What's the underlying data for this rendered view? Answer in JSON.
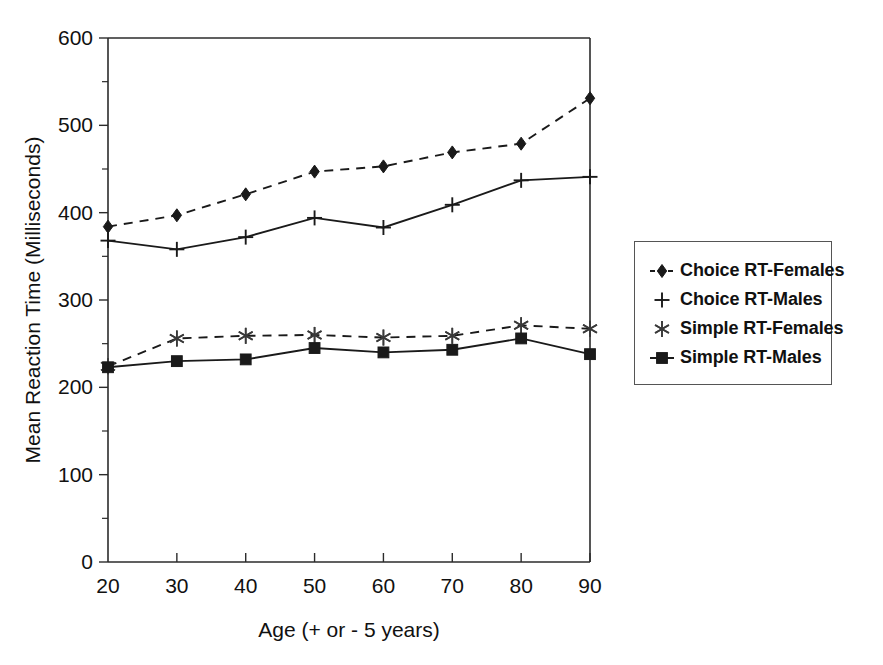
{
  "chart_data": {
    "type": "line",
    "title": "",
    "xlabel": "Age (+ or - 5 years)",
    "ylabel": "Mean Reaction Time (Milliseconds)",
    "x": [
      20,
      30,
      40,
      50,
      60,
      70,
      80,
      90
    ],
    "xtick_labels": [
      "20",
      "30",
      "40",
      "50",
      "60",
      "70",
      "80",
      "90"
    ],
    "ytick_labels": [
      "0",
      "100",
      "200",
      "300",
      "400",
      "500",
      "600"
    ],
    "yticks": [
      0,
      100,
      200,
      300,
      400,
      500,
      600
    ],
    "xlim": [
      20,
      90
    ],
    "ylim": [
      0,
      600
    ],
    "minor_ticks": true,
    "grid": false,
    "legend_position": "right",
    "series": [
      {
        "name": "Choice RT-Females",
        "marker": "diamond",
        "linestyle": "dashed",
        "values": [
          384,
          397,
          421,
          447,
          453,
          469,
          479,
          531
        ]
      },
      {
        "name": "Choice RT-Males",
        "marker": "plus",
        "linestyle": "solid",
        "values": [
          368,
          358,
          372,
          394,
          383,
          409,
          437,
          441
        ]
      },
      {
        "name": "Simple RT-Females",
        "marker": "star",
        "linestyle": "dashed",
        "values": [
          224,
          256,
          259,
          260,
          257,
          259,
          271,
          267
        ]
      },
      {
        "name": "Simple RT-Males",
        "marker": "square",
        "linestyle": "solid",
        "values": [
          223,
          230,
          232,
          245,
          240,
          243,
          256,
          238
        ]
      }
    ]
  },
  "legend": {
    "items": [
      {
        "label": "Choice RT-Females",
        "glyph": "diamond-dashed-icon"
      },
      {
        "label": "Choice RT-Males",
        "glyph": "plus-icon"
      },
      {
        "label": "Simple RT-Females",
        "glyph": "star-icon"
      },
      {
        "label": "Simple RT-Males",
        "glyph": "square-dashed-icon"
      }
    ]
  },
  "colors": {
    "series": "#1a1a1a",
    "axis": "#2b2b2b",
    "background": "#ffffff",
    "legend_border": "#555555"
  }
}
